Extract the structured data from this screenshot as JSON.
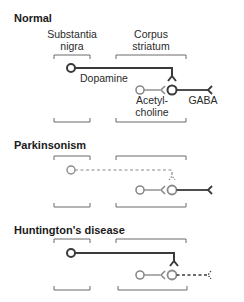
{
  "colors": {
    "dark": "#3a3a3a",
    "grey": "#8a8a8a",
    "bracket": "#6a6a6a",
    "text": "#222222"
  },
  "panels": [
    {
      "title": "Normal",
      "region_labels": {
        "substantia_nigra": [
          "Substantia",
          "nigra"
        ],
        "corpus_striatum": [
          "Corpus",
          "striatum"
        ]
      },
      "neuron_labels": {
        "dopamine": "Dopamine",
        "acetylcholine": [
          "Acetyl-",
          "choline"
        ],
        "gaba": "GABA"
      },
      "dopamine_pathway": "intact",
      "gaba_pathway": "intact"
    },
    {
      "title": "Parkinsonism",
      "dopamine_pathway": "degenerated (dashed)",
      "gaba_pathway": "intact"
    },
    {
      "title": "Huntington's disease",
      "dopamine_pathway": "intact",
      "gaba_pathway": "degenerated (dashed)"
    }
  ]
}
